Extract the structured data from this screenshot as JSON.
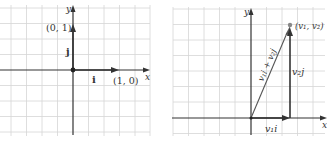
{
  "colors": {
    "grid": "#d6d6d6",
    "axis": "#333333",
    "vector": "#444444",
    "label": "#333333",
    "point": "#888888"
  },
  "left_diagram": {
    "x_axis_label": "x",
    "y_axis_label": "y",
    "i_vector_label": "i",
    "j_vector_label": "j",
    "i_endpoint_label": "(1, 0)",
    "j_endpoint_label": "(0, 1)"
  },
  "right_diagram": {
    "x_axis_label": "x",
    "y_axis_label": "y",
    "point_label": "(v₁, v₂)",
    "horizontal_component_label": "v₁i",
    "vertical_component_label": "v₂j",
    "resultant_label": "v₁i + v₂j"
  }
}
